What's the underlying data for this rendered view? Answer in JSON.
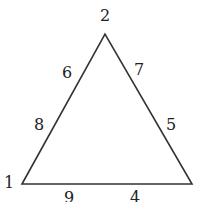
{
  "diagram": {
    "type": "triangle-number-puzzle",
    "stroke_color": "#333333",
    "vertices": [
      {
        "id": "v1",
        "label": "1",
        "x": 22,
        "y": 184
      },
      {
        "id": "v2",
        "label": "2",
        "x": 105,
        "y": 34
      },
      {
        "id": "v3",
        "label": "",
        "x": 192,
        "y": 184
      }
    ],
    "edges": {
      "left": {
        "labels": [
          "6",
          "8"
        ]
      },
      "right": {
        "labels": [
          "7",
          "5"
        ]
      },
      "bottom": {
        "labels": [
          "9",
          "4"
        ]
      }
    }
  }
}
